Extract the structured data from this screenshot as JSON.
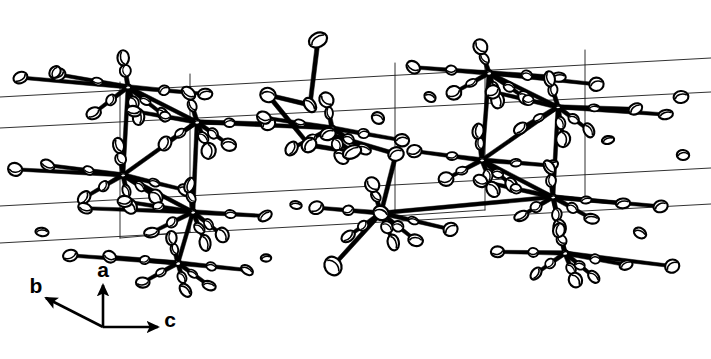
{
  "figure": {
    "kind": "ortep-crystal-packing-diagram",
    "width": 711,
    "height": 359,
    "background_color": "#ffffff",
    "ink_color": "#000000",
    "ellipsoid_fill": "#ffffff",
    "cell_line_color": "#1a1a1a"
  },
  "axis_indicator": {
    "name": "crystallographic-axis-triad",
    "origin": {
      "x": 103,
      "y": 327
    },
    "axes": [
      {
        "label": "a",
        "direction": "up",
        "tip": {
          "x": 103,
          "y": 285
        },
        "label_pos": {
          "x": 103,
          "y": 277
        }
      },
      {
        "label": "b",
        "direction": "upper-left",
        "tip": {
          "x": 46,
          "y": 298
        },
        "label_pos": {
          "x": 36,
          "y": 293
        }
      },
      {
        "label": "c",
        "direction": "right",
        "tip": {
          "x": 158,
          "y": 327
        },
        "label_pos": {
          "x": 170,
          "y": 327
        }
      }
    ]
  },
  "unit_cell": {
    "name": "unit-cell-outline",
    "stroke_width": 0.9,
    "edges": [
      {
        "x1": 0,
        "y1": 97,
        "x2": 711,
        "y2": 58
      },
      {
        "x1": 0,
        "y1": 128,
        "x2": 711,
        "y2": 92
      },
      {
        "x1": 0,
        "y1": 206,
        "x2": 711,
        "y2": 168
      },
      {
        "x1": 0,
        "y1": 243,
        "x2": 711,
        "y2": 204
      },
      {
        "x1": 120,
        "y1": 82,
        "x2": 120,
        "y2": 238
      },
      {
        "x1": 190,
        "y1": 74,
        "x2": 190,
        "y2": 232
      },
      {
        "x1": 395,
        "y1": 63,
        "x2": 395,
        "y2": 216
      },
      {
        "x1": 485,
        "y1": 56,
        "x2": 485,
        "y2": 210
      },
      {
        "x1": 585,
        "y1": 50,
        "x2": 585,
        "y2": 200
      },
      {
        "x1": 120,
        "y1": 238,
        "x2": 190,
        "y2": 232
      },
      {
        "x1": 395,
        "y1": 216,
        "x2": 485,
        "y2": 210
      }
    ]
  },
  "molecule": {
    "name": "crystal-packing-content",
    "metal_centers": [
      {
        "id": "M1",
        "x": 128,
        "y": 87
      },
      {
        "id": "M2",
        "x": 197,
        "y": 122
      },
      {
        "id": "M3",
        "x": 123,
        "y": 175
      },
      {
        "id": "M4",
        "x": 193,
        "y": 212
      },
      {
        "id": "M5",
        "x": 178,
        "y": 263
      },
      {
        "id": "M6",
        "x": 489,
        "y": 73
      },
      {
        "id": "M7",
        "x": 558,
        "y": 107
      },
      {
        "id": "M8",
        "x": 482,
        "y": 160
      },
      {
        "id": "M9",
        "x": 553,
        "y": 197
      },
      {
        "id": "M10",
        "x": 565,
        "y": 253
      },
      {
        "id": "M11",
        "x": 381,
        "y": 213
      },
      {
        "id": "M12",
        "x": 332,
        "y": 128
      }
    ],
    "bridge_chain": [
      {
        "x": 318,
        "y": 40
      },
      {
        "x": 310,
        "y": 105
      },
      {
        "x": 268,
        "y": 95
      },
      {
        "x": 309,
        "y": 145
      },
      {
        "x": 352,
        "y": 152
      },
      {
        "x": 328,
        "y": 134
      },
      {
        "x": 396,
        "y": 154
      },
      {
        "x": 381,
        "y": 213
      },
      {
        "x": 333,
        "y": 266
      }
    ],
    "ellipsoid_count": 168,
    "bond_count": 150
  }
}
